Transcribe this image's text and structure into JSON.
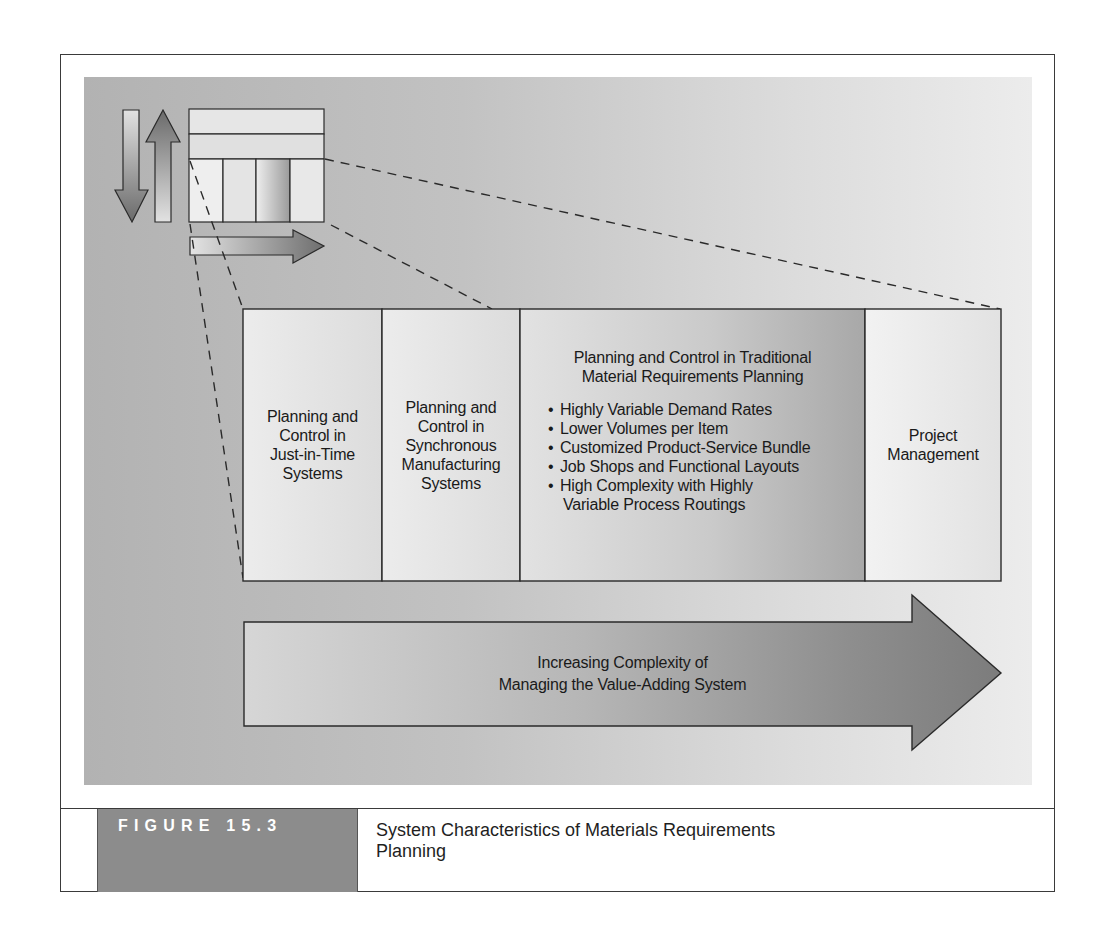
{
  "figure": {
    "label": "FIGURE 15.3",
    "title": "System Characteristics of Materials Requirements Planning",
    "title_lines": [
      "System Characteristics of Materials Requirements",
      "Planning"
    ]
  },
  "columns": [
    {
      "id": "jit",
      "lines": [
        "Planning and",
        "Control in",
        "Just-in-Time",
        "Systems"
      ]
    },
    {
      "id": "synchronous",
      "lines": [
        "Planning and",
        "Control in",
        "Synchronous",
        "Manufacturing",
        "Systems"
      ]
    },
    {
      "id": "mrp",
      "title_lines": [
        "Planning and Control in Traditional",
        "Material Requirements Planning"
      ],
      "bullets": [
        "Highly Variable Demand Rates",
        "Lower Volumes per Item",
        "Customized Product-Service Bundle",
        "Job Shops and Functional Layouts",
        "High Complexity with Highly"
      ],
      "bullet_continuation": "Variable Process Routings"
    },
    {
      "id": "project",
      "lines": [
        "Project",
        "Management"
      ]
    }
  ],
  "big_arrow": {
    "lines": [
      "Increasing Complexity of",
      "Managing the Value-Adding System"
    ]
  },
  "icons": {
    "down_arrow": "down-arrow-icon",
    "up_arrow": "up-arrow-icon",
    "mini_table": "mini-table-icon",
    "small_right_arrow": "right-arrow-icon"
  },
  "colors": {
    "panel_left": "#b2b2b2",
    "panel_right": "#ececec",
    "figure_label_bg": "#8c8c8c",
    "stroke": "#2a2a2a"
  }
}
